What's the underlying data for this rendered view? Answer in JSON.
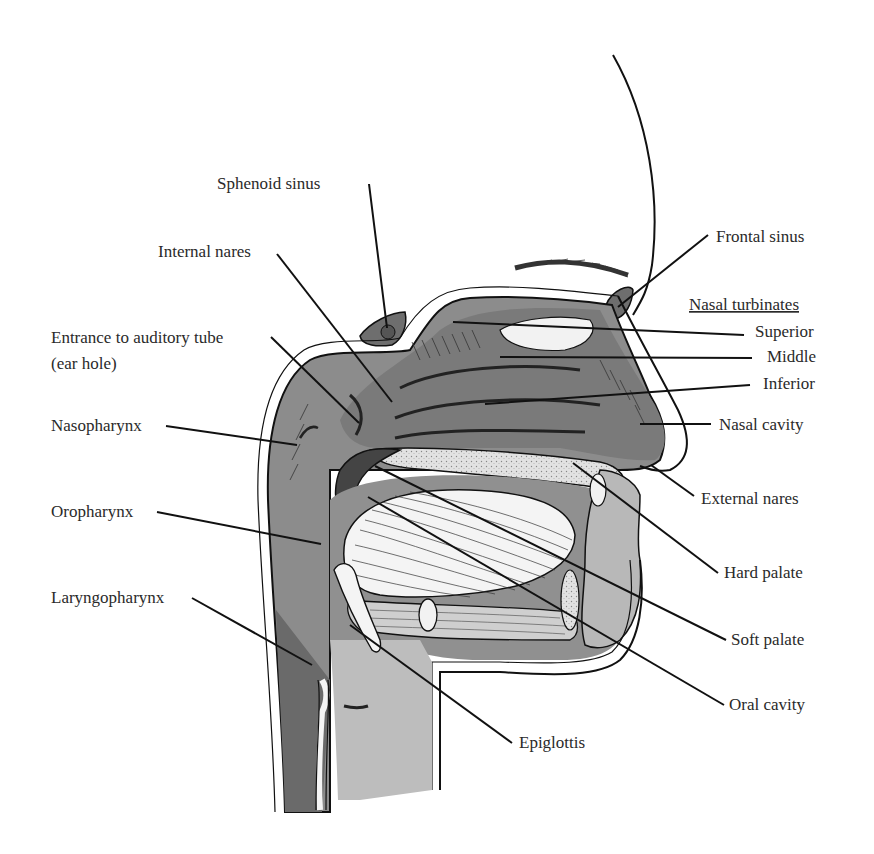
{
  "diagram": {
    "colors": {
      "background": "#ffffff",
      "dark_tissue": "#6e6e6e",
      "mid_tissue": "#8c8c8c",
      "light_tissue": "#b5b5b5",
      "bone": "#e6e6e6",
      "line": "#111111",
      "text": "#2a2a2a"
    },
    "labels": {
      "sphenoid_sinus": "Sphenoid sinus",
      "internal_nares": "Internal nares",
      "entrance_auditory_tube_line1": "Entrance to auditory tube",
      "entrance_auditory_tube_line2": "(ear hole)",
      "nasopharynx": "Nasopharynx",
      "oropharynx": "Oropharynx",
      "laryngopharynx": "Laryngopharynx",
      "frontal_sinus": "Frontal sinus",
      "nasal_turbinates_heading": "Nasal turbinates",
      "superior": "Superior",
      "middle": "Middle",
      "inferior": "Inferior",
      "nasal_cavity": "Nasal cavity",
      "external_nares": "External nares",
      "hard_palate": "Hard palate",
      "soft_palate": "Soft palate",
      "oral_cavity": "Oral cavity",
      "epiglottis": "Epiglottis"
    }
  }
}
